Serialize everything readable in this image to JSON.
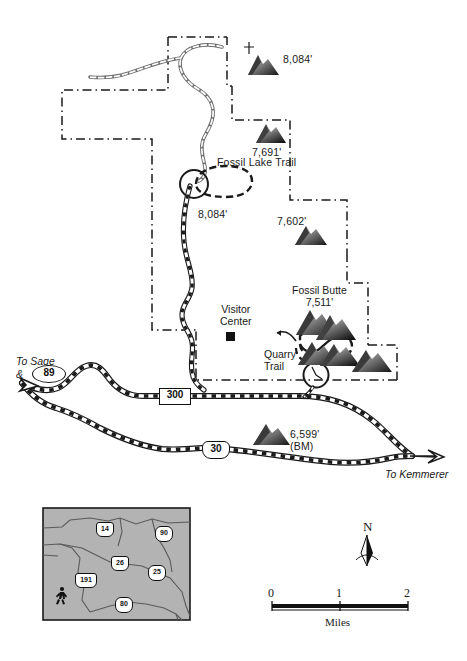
{
  "map": {
    "title": "Fossil Butte National Monument Map",
    "colors": {
      "ink": "#1a1a1a",
      "paper": "#ffffff",
      "boundary": "#1a1a1a",
      "inset_fill": "#b3b3b3",
      "inset_line": "#555555",
      "road_fill": "#ffffff",
      "road_casing": "#1a1a1a"
    },
    "peaks": [
      {
        "name": "peak-8084-north",
        "label": "8,084'",
        "x": 258,
        "y": 58
      },
      {
        "name": "peak-7691",
        "label": "7,691'",
        "x": 265,
        "y": 150
      },
      {
        "name": "peak-8084-lake",
        "label": "8,084'",
        "x": 213,
        "y": 215
      },
      {
        "name": "peak-7602",
        "label": "7,602'",
        "x": 297,
        "y": 222
      },
      {
        "name": "peak-fossil-butte",
        "label": "7,511'",
        "x": 322,
        "y": 310
      },
      {
        "name": "peak-6599",
        "label": "6,599'",
        "x": 291,
        "y": 432
      }
    ],
    "place_labels": [
      {
        "name": "fossil-lake-trail-label",
        "text": "Fossil Lake Trail",
        "x": 222,
        "y": 162
      },
      {
        "name": "visitor-center-label",
        "line1": "Visitor",
        "line2": "Center",
        "x": 222,
        "y": 311
      },
      {
        "name": "fossil-butte-label",
        "line1": "Fossil Butte",
        "line2": "7,511'",
        "x": 302,
        "y": 290
      },
      {
        "name": "quarry-trail-label",
        "line1": "Quarry",
        "line2": "Trail",
        "x": 272,
        "y": 353
      },
      {
        "name": "bm-label",
        "text": "(BM)",
        "x": 287,
        "y": 443
      },
      {
        "name": "to-sage-label",
        "text": "To Sage",
        "x": 14,
        "y": 358
      },
      {
        "name": "ampersand-label",
        "text": "&",
        "x": 14,
        "y": 372
      },
      {
        "name": "to-kemmerer-label",
        "text": "To Kemmerer",
        "x": 386,
        "y": 473
      }
    ],
    "highway_shields": [
      {
        "name": "shield-us-89",
        "number": "89",
        "style": "us-oval",
        "x": 42,
        "y": 373
      },
      {
        "name": "shield-state-300",
        "number": "300",
        "style": "rect",
        "x": 161,
        "y": 396
      },
      {
        "name": "shield-us-30",
        "number": "30",
        "style": "us-shield",
        "x": 212,
        "y": 448
      }
    ],
    "elevation_units": "feet"
  },
  "inset": {
    "name": "wyoming-locator-inset",
    "state_outline": "Wyoming",
    "shields": [
      {
        "name": "inset-shield-14",
        "number": "14",
        "style": "us-shield",
        "x": 103,
        "y": 529
      },
      {
        "name": "inset-shield-90",
        "number": "90",
        "style": "interstate",
        "x": 162,
        "y": 533
      },
      {
        "name": "inset-shield-26",
        "number": "26",
        "style": "us-shield",
        "x": 118,
        "y": 563
      },
      {
        "name": "inset-shield-25",
        "number": "25",
        "style": "interstate",
        "x": 155,
        "y": 572
      },
      {
        "name": "inset-shield-191",
        "number": "191",
        "style": "us-shield",
        "x": 84,
        "y": 580
      },
      {
        "name": "inset-shield-80",
        "number": "80",
        "style": "interstate",
        "x": 122,
        "y": 604
      }
    ],
    "park_marker": {
      "name": "hiker-icon",
      "symbol": "hiker",
      "x": 62,
      "y": 595
    }
  },
  "legend": {
    "north_arrow": {
      "name": "north-arrow",
      "label": "N"
    },
    "scale_bar": {
      "name": "scale-bar",
      "ticks": [
        "0",
        "1",
        "2"
      ],
      "units_label": "Miles",
      "min": 0,
      "max": 2
    }
  }
}
